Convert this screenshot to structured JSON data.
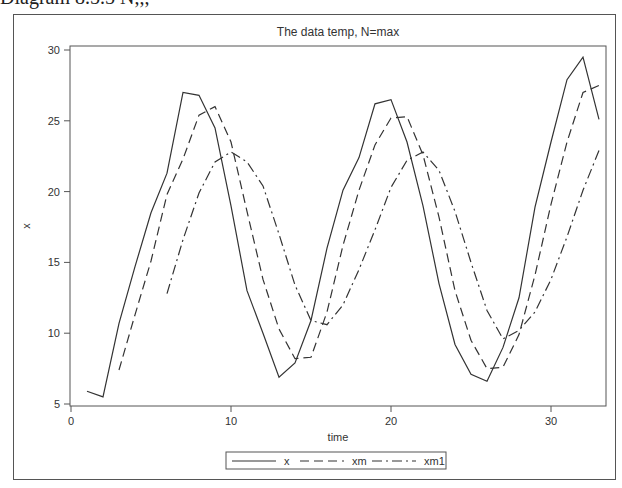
{
  "header_fragment": "Diagram 8.5.5   N,,,",
  "chart_data": {
    "type": "line",
    "title": "The data temp, N=max",
    "xlabel": "time",
    "ylabel": "x",
    "xlim": [
      0,
      33.4
    ],
    "ylim": [
      5,
      30
    ],
    "xticks": [
      0,
      10,
      20,
      30
    ],
    "yticks": [
      5,
      10,
      15,
      20,
      25,
      30
    ],
    "grid": false,
    "legend_position": "bottom",
    "series": [
      {
        "name": "x",
        "style": "solid",
        "x": [
          1,
          2,
          3,
          4,
          5,
          6,
          7,
          8,
          9,
          10,
          11,
          12,
          13,
          14,
          15,
          16,
          17,
          18,
          19,
          20,
          21,
          22,
          23,
          24,
          25,
          26,
          27,
          28,
          29,
          30,
          31,
          32,
          33
        ],
        "values": [
          5.9,
          5.5,
          10.7,
          14.7,
          18.5,
          21.3,
          27.0,
          26.8,
          24.5,
          19.0,
          13.0,
          10.0,
          6.9,
          7.9,
          10.9,
          16.0,
          20.1,
          22.4,
          26.2,
          26.5,
          23.5,
          19.0,
          13.5,
          9.2,
          7.1,
          6.6,
          9.0,
          12.5,
          18.9,
          23.5,
          27.9,
          29.5,
          25.1
        ]
      },
      {
        "name": "xm",
        "style": "dashed",
        "x": [
          3,
          4,
          5,
          6,
          7,
          8,
          9,
          10,
          11,
          12,
          13,
          14,
          15,
          16,
          17,
          18,
          19,
          20,
          21,
          22,
          23,
          24,
          25,
          26,
          27,
          28,
          29,
          30,
          31,
          32,
          33
        ],
        "values": [
          7.4,
          11.3,
          15.1,
          19.8,
          22.3,
          25.4,
          26.0,
          23.5,
          18.6,
          13.8,
          10.3,
          8.2,
          8.3,
          11.5,
          16.2,
          20.1,
          23.3,
          25.2,
          25.3,
          22.6,
          18.2,
          13.0,
          9.5,
          7.5,
          7.6,
          9.9,
          14.1,
          19.1,
          23.5,
          27.0,
          27.5
        ]
      },
      {
        "name": "xm1",
        "style": "dash-dot",
        "x": [
          6,
          7,
          8,
          9,
          10,
          11,
          12,
          13,
          14,
          15,
          16,
          17,
          18,
          19,
          20,
          21,
          22,
          23,
          24,
          25,
          26,
          27,
          28,
          29,
          30,
          31,
          32,
          33
        ],
        "values": [
          12.8,
          16.6,
          19.9,
          22.1,
          22.8,
          22.1,
          20.4,
          17.0,
          13.4,
          10.9,
          10.6,
          12.0,
          14.5,
          17.3,
          20.3,
          22.2,
          22.8,
          21.5,
          18.6,
          15.0,
          11.6,
          9.6,
          10.2,
          11.5,
          13.8,
          16.8,
          20.1,
          22.9
        ]
      }
    ]
  },
  "legend": {
    "items": [
      "x",
      "xm",
      "xm1"
    ]
  },
  "colors": {
    "line": "#333333",
    "axis": "#555555",
    "text": "#333333"
  }
}
